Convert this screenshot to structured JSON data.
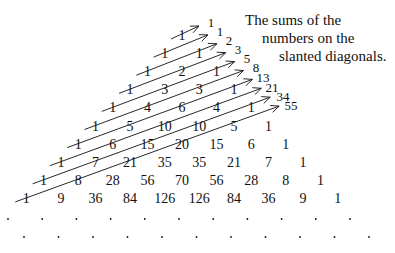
{
  "diagram": {
    "caption": {
      "lines": [
        "The sums of the",
        "numbers on the",
        "slanted diagonals."
      ]
    },
    "colors": {
      "ink": "#111111",
      "background": "#ffffff"
    },
    "triangle_rows": [
      [
        "1"
      ],
      [
        "1",
        "1"
      ],
      [
        "1",
        "2",
        "1"
      ],
      [
        "1",
        "3",
        "3",
        "1"
      ],
      [
        "1",
        "4",
        "6",
        "4",
        "1"
      ],
      [
        "1",
        "5",
        "10",
        "10",
        "5",
        "1"
      ],
      [
        "1",
        "6",
        "15",
        "20",
        "15",
        "6",
        "1"
      ],
      [
        "1",
        "7",
        "21",
        "35",
        "35",
        "21",
        "7",
        "1"
      ],
      [
        "1",
        "8",
        "28",
        "56",
        "70",
        "56",
        "28",
        "8",
        "1"
      ],
      [
        "1",
        "9",
        "36",
        "84",
        "126",
        "126",
        "84",
        "36",
        "9",
        "1"
      ]
    ],
    "diagonal_sums": [
      "1",
      "1",
      "2",
      "3",
      "5",
      "8",
      "13",
      "21",
      "34",
      "55"
    ],
    "continuation": {
      "row_a_dots": 11,
      "row_b_dots": 11,
      "symbol": "."
    }
  }
}
